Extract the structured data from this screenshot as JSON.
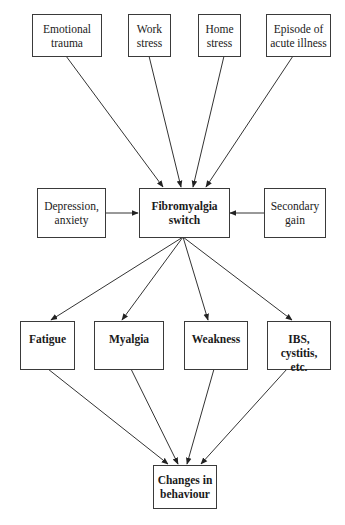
{
  "diagram": {
    "type": "flowchart",
    "nodes": {
      "emotional_trauma": {
        "label": "Emotional\ntrauma",
        "bold": false
      },
      "work_stress": {
        "label": "Work\nstress",
        "bold": false
      },
      "home_stress": {
        "label": "Home\nstress",
        "bold": false
      },
      "acute_illness": {
        "label": "Episode of\nacute illness",
        "bold": false
      },
      "depression_anxiety": {
        "label": "Depression,\nanxiety",
        "bold": false
      },
      "fibromyalgia_switch": {
        "label": "Fibromyalgia\nswitch",
        "bold": true
      },
      "secondary_gain": {
        "label": "Secondary\ngain",
        "bold": false
      },
      "fatigue": {
        "label": "Fatigue",
        "bold": true
      },
      "myalgia": {
        "label": "Myalgia",
        "bold": true
      },
      "weakness": {
        "label": "Weakness",
        "bold": true
      },
      "ibs_cystitis": {
        "label": "IBS, cystitis,\netc.",
        "bold": true
      },
      "changes_behaviour": {
        "label": "Changes in\nbehaviour",
        "bold": true
      }
    },
    "edges": [
      {
        "from": "emotional_trauma",
        "to": "fibromyalgia_switch"
      },
      {
        "from": "work_stress",
        "to": "fibromyalgia_switch"
      },
      {
        "from": "home_stress",
        "to": "fibromyalgia_switch"
      },
      {
        "from": "acute_illness",
        "to": "fibromyalgia_switch"
      },
      {
        "from": "depression_anxiety",
        "to": "fibromyalgia_switch"
      },
      {
        "from": "secondary_gain",
        "to": "fibromyalgia_switch"
      },
      {
        "from": "fibromyalgia_switch",
        "to": "fatigue"
      },
      {
        "from": "fibromyalgia_switch",
        "to": "myalgia"
      },
      {
        "from": "fibromyalgia_switch",
        "to": "weakness"
      },
      {
        "from": "fibromyalgia_switch",
        "to": "ibs_cystitis"
      },
      {
        "from": "fatigue",
        "to": "changes_behaviour"
      },
      {
        "from": "myalgia",
        "to": "changes_behaviour"
      },
      {
        "from": "weakness",
        "to": "changes_behaviour"
      },
      {
        "from": "ibs_cystitis",
        "to": "changes_behaviour"
      }
    ],
    "colors": {
      "stroke": "#3a3a3a",
      "background": "#ffffff",
      "text": "#1a1a1a"
    }
  }
}
